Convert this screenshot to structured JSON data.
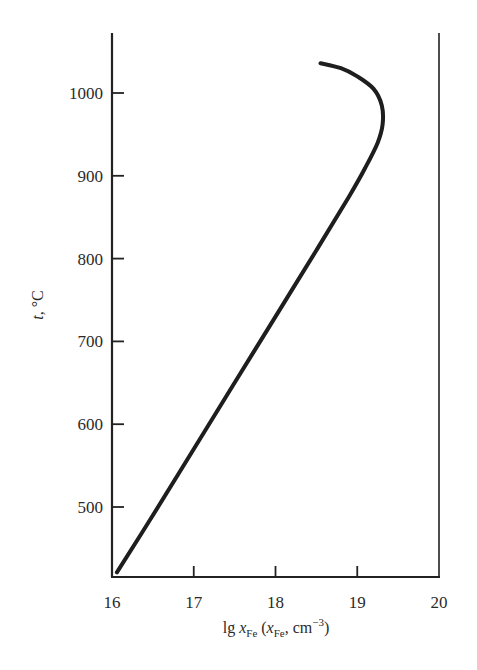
{
  "chart_data": {
    "type": "line",
    "title": "",
    "xlabel": "lg x_Fe (x_Fe, cm^-3)",
    "xlabel_parts": {
      "main": "lg ",
      "var": "x",
      "sub": "Fe",
      "paren_open": " (",
      "var2": "x",
      "sub2": "Fe",
      "unit": ", cm",
      "sup": "−3",
      "paren_close": ")"
    },
    "ylabel": "t, °C",
    "ylabel_parts": {
      "var": "t",
      "rest": ", °C"
    },
    "xlim": [
      16,
      20
    ],
    "ylim": [
      415,
      1085
    ],
    "xticks": [
      16,
      17,
      18,
      19,
      20
    ],
    "xtick_labels": [
      "16",
      "17",
      "18",
      "19",
      "20"
    ],
    "yticks": [
      500,
      600,
      700,
      800,
      900,
      1000
    ],
    "ytick_labels": [
      "500",
      "600",
      "700",
      "800",
      "900",
      "1000"
    ],
    "grid": false,
    "legend": null,
    "series": [
      {
        "name": "curve",
        "color": "#1e1e1e",
        "x": [
          16.06,
          16.5,
          17.0,
          17.5,
          18.0,
          18.5,
          18.9,
          19.1,
          19.25,
          19.31,
          19.3,
          19.2,
          19.0,
          18.8,
          18.55
        ],
        "y": [
          421,
          490,
          570,
          650,
          730,
          810,
          875,
          910,
          940,
          962,
          985,
          1005,
          1020,
          1030,
          1036
        ]
      }
    ]
  }
}
